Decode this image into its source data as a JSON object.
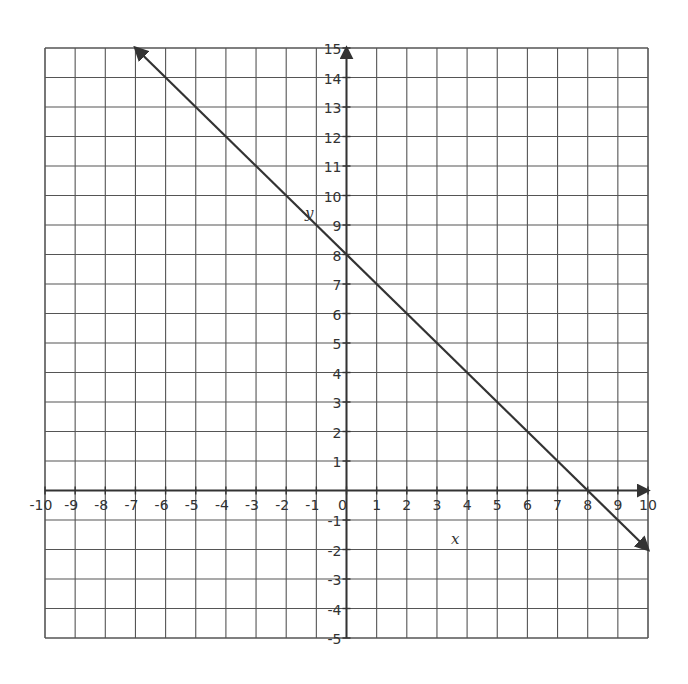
{
  "chart_data": {
    "type": "line",
    "title": "",
    "xlabel": "x",
    "ylabel": "y",
    "xlim": [
      -10,
      10
    ],
    "ylim": [
      -5,
      15
    ],
    "grid": true,
    "x_ticks": [
      -10,
      -9,
      -8,
      -7,
      -6,
      -5,
      -4,
      -3,
      -2,
      -1,
      0,
      1,
      2,
      3,
      4,
      5,
      6,
      7,
      8,
      9,
      10
    ],
    "y_ticks": [
      -5,
      -4,
      -3,
      -2,
      -1,
      1,
      2,
      3,
      4,
      5,
      6,
      7,
      8,
      9,
      10,
      11,
      12,
      13,
      14,
      15
    ],
    "x_tick_labels": [
      "-10",
      "-9",
      "-8",
      "-7",
      "-6",
      "-5",
      "-4",
      "-3",
      "-2",
      "-1",
      "0",
      "1",
      "2",
      "3",
      "4",
      "5",
      "6",
      "7",
      "8",
      "9",
      "10"
    ],
    "y_tick_labels": [
      "-5",
      "-4",
      "-3",
      "-2",
      "-1",
      "1",
      "2",
      "3",
      "4",
      "5",
      "6",
      "7",
      "8",
      "9",
      "10",
      "11",
      "12",
      "13",
      "14",
      "15"
    ],
    "series": [
      {
        "name": "line",
        "equation": "y = -x + 8",
        "x": [
          -7,
          10
        ],
        "y": [
          15,
          -2
        ],
        "arrows": "both",
        "color": "#333333"
      }
    ],
    "intercepts": {
      "x_intercept": 8,
      "y_intercept": 8
    }
  },
  "colors": {
    "grid": "#555555",
    "axis": "#333333",
    "line": "#333333"
  }
}
